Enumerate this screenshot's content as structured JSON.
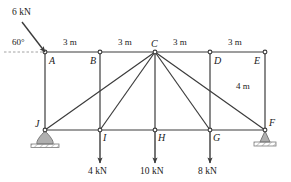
{
  "diagram": {
    "stroke_color": "#3c3c3c",
    "text_color": "#1a1a1a",
    "support_fill": "#b0b0b0",
    "background": "#ffffff"
  },
  "joints": [
    {
      "id": "A",
      "label": "A",
      "x": 45,
      "y": 52,
      "label_dx": 4,
      "label_dy": 4
    },
    {
      "id": "B",
      "label": "B",
      "x": 100,
      "y": 52,
      "label_dx": -10,
      "label_dy": 4
    },
    {
      "id": "C",
      "label": "C",
      "x": 155,
      "y": 52,
      "label_dx": -4,
      "label_dy": -13
    },
    {
      "id": "D",
      "label": "D",
      "x": 210,
      "y": 52,
      "label_dx": 4,
      "label_dy": 4
    },
    {
      "id": "E",
      "label": "E",
      "x": 265,
      "y": 52,
      "label_dx": -11,
      "label_dy": 4
    },
    {
      "id": "F",
      "label": "F",
      "x": 265,
      "y": 130,
      "label_dx": 4,
      "label_dy": -12
    },
    {
      "id": "G",
      "label": "G",
      "x": 210,
      "y": 130,
      "label_dx": 3,
      "label_dy": 3
    },
    {
      "id": "H",
      "label": "H",
      "x": 155,
      "y": 130,
      "label_dx": 3,
      "label_dy": 3
    },
    {
      "id": "I",
      "label": "I",
      "x": 100,
      "y": 130,
      "label_dx": 3,
      "label_dy": 3
    },
    {
      "id": "J",
      "label": "J",
      "x": 45,
      "y": 130,
      "label_dx": -10,
      "label_dy": -11
    }
  ],
  "members": [
    {
      "name": "top-chord-A-B",
      "from": "A",
      "to": "B"
    },
    {
      "name": "top-chord-B-C",
      "from": "B",
      "to": "C"
    },
    {
      "name": "top-chord-C-D",
      "from": "C",
      "to": "D"
    },
    {
      "name": "top-chord-D-E",
      "from": "D",
      "to": "E"
    },
    {
      "name": "bottom-chord-J-I",
      "from": "J",
      "to": "I"
    },
    {
      "name": "bottom-chord-I-H",
      "from": "I",
      "to": "H"
    },
    {
      "name": "bottom-chord-H-G",
      "from": "H",
      "to": "G"
    },
    {
      "name": "bottom-chord-G-F",
      "from": "G",
      "to": "F"
    },
    {
      "name": "vertical-A-J",
      "from": "A",
      "to": "J"
    },
    {
      "name": "vertical-B-I",
      "from": "B",
      "to": "I"
    },
    {
      "name": "vertical-C-H",
      "from": "C",
      "to": "H"
    },
    {
      "name": "vertical-D-G",
      "from": "D",
      "to": "G"
    },
    {
      "name": "vertical-E-F",
      "from": "E",
      "to": "F"
    },
    {
      "name": "diagonal-C-J",
      "from": "C",
      "to": "J"
    },
    {
      "name": "diagonal-C-I",
      "from": "C",
      "to": "I"
    },
    {
      "name": "diagonal-C-G",
      "from": "C",
      "to": "G"
    },
    {
      "name": "diagonal-C-F",
      "from": "C",
      "to": "F"
    }
  ],
  "dimensions": {
    "top_spans": [
      {
        "label": "3 m",
        "x": 63,
        "y": 38
      },
      {
        "label": "3 m",
        "x": 118,
        "y": 38
      },
      {
        "label": "3 m",
        "x": 173,
        "y": 38
      },
      {
        "label": "3 m",
        "x": 228,
        "y": 38
      }
    ],
    "height": {
      "label": "4 m",
      "x": 236,
      "y": 82
    }
  },
  "loads": [
    {
      "name": "load-6kN-at-A",
      "label": "6 kN",
      "magnitude": 6,
      "unit": "kN",
      "angle_label": "60°",
      "angle_deg": 60,
      "label_x": 12,
      "label_y": 8,
      "angle_label_x": 12,
      "angle_label_y": 38,
      "tail_x": 22,
      "tail_y": 22,
      "head_x": 45,
      "head_y": 52
    },
    {
      "name": "load-4kN-at-I",
      "label": "4 kN",
      "magnitude": 4,
      "unit": "kN",
      "joint": "I",
      "tail_x": 100,
      "tail_y": 132,
      "head_x": 100,
      "head_y": 163,
      "label_x": 88,
      "label_y": 167
    },
    {
      "name": "load-10kN-at-H",
      "label": "10 kN",
      "magnitude": 10,
      "unit": "kN",
      "joint": "H",
      "tail_x": 155,
      "tail_y": 132,
      "head_x": 155,
      "head_y": 163,
      "label_x": 140,
      "label_y": 167
    },
    {
      "name": "load-8kN-at-G",
      "label": "8 kN",
      "magnitude": 8,
      "unit": "kN",
      "joint": "G",
      "tail_x": 210,
      "tail_y": 132,
      "head_x": 210,
      "head_y": 163,
      "label_x": 198,
      "label_y": 167
    }
  ],
  "supports": [
    {
      "name": "pin-support-J",
      "type": "pin",
      "joint": "J",
      "x": 45,
      "y": 130
    },
    {
      "name": "roller-support-F",
      "type": "roller",
      "joint": "F",
      "x": 265,
      "y": 130
    }
  ]
}
